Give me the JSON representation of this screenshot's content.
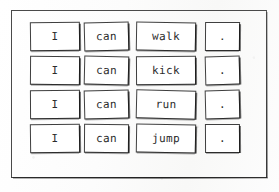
{
  "worksheet": {
    "title": "I can sentence cards",
    "frame": {
      "name": "outer-border"
    },
    "columns": [
      "subject",
      "verb",
      "action",
      "punctuation"
    ],
    "rows": [
      {
        "sentence": "I can walk.",
        "cards": [
          {
            "text": "I",
            "role": "subject"
          },
          {
            "text": "can",
            "role": "verb"
          },
          {
            "text": "walk",
            "role": "action"
          },
          {
            "text": ".",
            "role": "punctuation"
          }
        ]
      },
      {
        "sentence": "I can kick.",
        "cards": [
          {
            "text": "I",
            "role": "subject"
          },
          {
            "text": "can",
            "role": "verb"
          },
          {
            "text": "kick",
            "role": "action"
          },
          {
            "text": ".",
            "role": "punctuation"
          }
        ]
      },
      {
        "sentence": "I can run.",
        "cards": [
          {
            "text": "I",
            "role": "subject"
          },
          {
            "text": "can",
            "role": "verb"
          },
          {
            "text": "run",
            "role": "action"
          },
          {
            "text": ".",
            "role": "punctuation"
          }
        ]
      },
      {
        "sentence": "I can jump.",
        "cards": [
          {
            "text": "I",
            "role": "subject"
          },
          {
            "text": "can",
            "role": "verb"
          },
          {
            "text": "jump",
            "role": "action"
          },
          {
            "text": ".",
            "role": "punctuation"
          }
        ]
      }
    ],
    "colors": {
      "paper": "#fdfdfd",
      "ink": "#2b2b2b",
      "border": "#3f3f3f",
      "frame": "#4a4a4a"
    }
  }
}
